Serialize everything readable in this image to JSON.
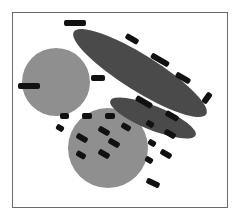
{
  "diagram": {
    "type": "venn-like",
    "colors": {
      "circle_fill": "#8f8f8f",
      "ellipse_fill": "#4a4a4a",
      "label_fill": "#111111",
      "frame_stroke": "#6a6a6a"
    },
    "shapes": [
      {
        "name": "circle-left",
        "kind": "circle"
      },
      {
        "name": "circle-bottom",
        "kind": "circle"
      },
      {
        "name": "ellipse-large",
        "kind": "ellipse"
      },
      {
        "name": "ellipse-small",
        "kind": "ellipse"
      }
    ],
    "labels_note": "All text labels are redacted (illegible black scribbles)",
    "labels": [
      "[redacted]",
      "[redacted]",
      "[redacted]",
      "[redacted]",
      "[redacted]",
      "[redacted]",
      "[redacted]",
      "[redacted]",
      "[redacted]",
      "[redacted]",
      "[redacted]",
      "[redacted]",
      "[redacted]",
      "[redacted]",
      "[redacted]",
      "[redacted]",
      "[redacted]",
      "[redacted]",
      "[redacted]",
      "[redacted]"
    ]
  }
}
